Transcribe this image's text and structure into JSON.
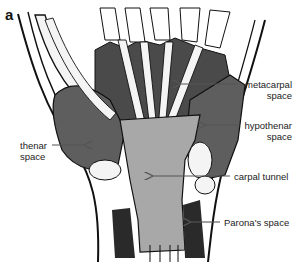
{
  "figure": {
    "panel_label": "a",
    "colors": {
      "background": "#ffffff",
      "outline": "#111111",
      "deep_space_dark": "#4a4a4a",
      "thenar_hypothenar": "#5e5e5e",
      "carpal_tunnel": "#a8a8a8",
      "tendon": "#f4f4f4",
      "parona_dark": "#2a2a2a"
    },
    "labels": {
      "metacarpal_line1": "metacarpal",
      "metacarpal_line2": "space",
      "hypothenar_line1": "hypothenar",
      "hypothenar_line2": "space",
      "thenar_line1": "thenar",
      "thenar_line2": "space",
      "carpal_tunnel": "carpal tunnel",
      "parona": "Parona's space"
    }
  }
}
